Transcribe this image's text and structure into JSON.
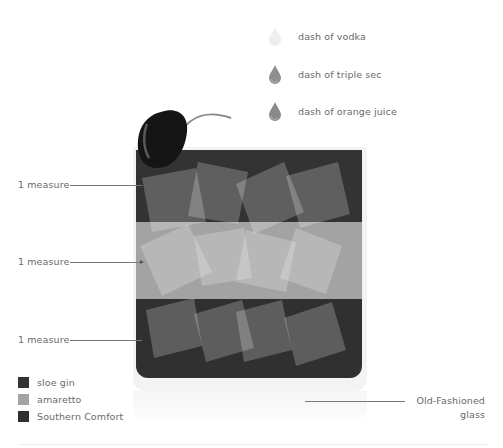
{
  "garnishes": [
    {
      "label": "dash of vodka",
      "icon": "drop-icon",
      "color": "#eeeeee"
    },
    {
      "label": "dash of triple sec",
      "icon": "drop-icon",
      "color": "#8f8f8f"
    },
    {
      "label": "dash of orange juice",
      "icon": "drop-icon",
      "color": "#8a8a8a"
    }
  ],
  "cherry": {
    "icon": "cherry-icon",
    "color": "#151515"
  },
  "layers": [
    {
      "label": "1 measure",
      "ingredient": "sloe gin",
      "color": "#333333"
    },
    {
      "label": "1 measure",
      "ingredient": "amaretto",
      "color": "#a3a3a3"
    },
    {
      "label": "1 measure",
      "ingredient": "Southern Comfort",
      "color": "#303030"
    }
  ],
  "legend": [
    {
      "label": "sloe gin",
      "color": "#333333"
    },
    {
      "label": "amaretto",
      "color": "#a3a3a3"
    },
    {
      "label": "Southern Comfort",
      "color": "#303030"
    }
  ],
  "glass": {
    "label_line1": "Old-Fashioned",
    "label_line2": "glass",
    "frame_color": "#f3f3f3"
  }
}
